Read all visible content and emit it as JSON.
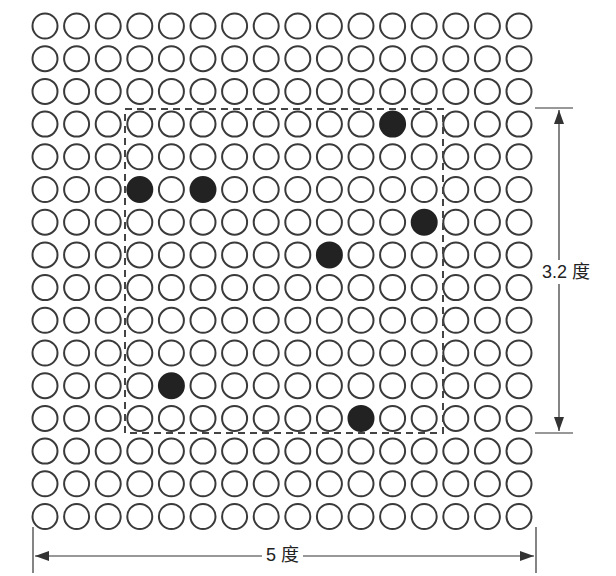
{
  "diagram": {
    "grid": {
      "rows": 16,
      "cols": 16,
      "origin_x": 45,
      "origin_y": 26,
      "spacing_x": 31.6,
      "spacing_y": 32.7,
      "radius": 12.5,
      "stroke_color": "#3a3a3a",
      "fill_color": "#ffffff",
      "filled_color": "#222222"
    },
    "filled_dots": [
      {
        "row": 3,
        "col": 11
      },
      {
        "row": 5,
        "col": 3
      },
      {
        "row": 5,
        "col": 5
      },
      {
        "row": 6,
        "col": 12
      },
      {
        "row": 7,
        "col": 9
      },
      {
        "row": 11,
        "col": 4
      },
      {
        "row": 12,
        "col": 10
      }
    ],
    "window": {
      "left": 125,
      "top": 109,
      "right": 443,
      "bottom": 433,
      "style": "dashed"
    },
    "dimensions": {
      "width_label": "5 度",
      "height_label": "3.2 度"
    }
  }
}
